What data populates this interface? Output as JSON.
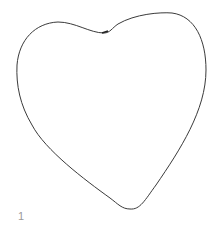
{
  "drawing": {
    "shape": "heart-outline",
    "stroke_color": "#3a3a3a",
    "background": "#ffffff"
  },
  "label": {
    "text": "1"
  }
}
